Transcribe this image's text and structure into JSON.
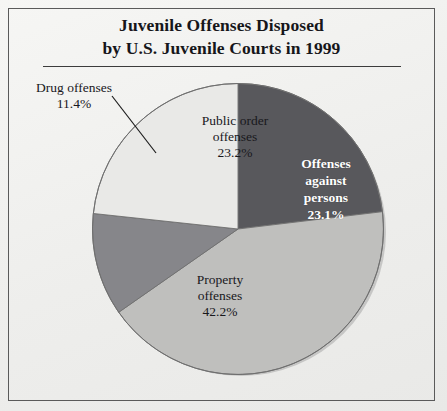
{
  "figure": {
    "title_line_1": "Juvenile Offenses Disposed",
    "title_line_2": "by U.S. Juvenile Courts in 1999"
  },
  "chart_data": {
    "type": "pie",
    "title": "Juvenile Offenses Disposed by U.S. Juvenile Courts in 1999",
    "xlabel": "",
    "ylabel": "",
    "legend_position": "none",
    "grid": false,
    "units": "percent",
    "categories": [
      "Offenses against persons",
      "Property offenses",
      "Drug offenses",
      "Public order offenses"
    ],
    "values": [
      23.1,
      42.2,
      11.4,
      23.2
    ],
    "slices": [
      {
        "label_line_1": "Offenses",
        "label_line_2": "against",
        "label_line_3": "persons",
        "name": "Offenses against persons",
        "value": 23.1,
        "value_label": "23.1%",
        "color": "#58585c",
        "label_color": "#ffffff",
        "start_angle_deg": 0,
        "end_angle_deg": 83.16,
        "leader_line": false
      },
      {
        "label_line_1": "Property",
        "label_line_2": "offenses",
        "name": "Property offenses",
        "value": 42.2,
        "value_label": "42.2%",
        "color": "#bfbfbd",
        "label_color": "#18181c",
        "start_angle_deg": 83.16,
        "end_angle_deg": 235.08,
        "leader_line": false
      },
      {
        "label_line_1": "Drug offenses",
        "name": "Drug offenses",
        "value": 11.4,
        "value_label": "11.4%",
        "color": "#86868a",
        "label_color": "#18181c",
        "start_angle_deg": 235.08,
        "end_angle_deg": 276.12,
        "leader_line": true
      },
      {
        "label_line_1": "Public order",
        "label_line_2": "offenses",
        "name": "Public order offenses",
        "value": 23.2,
        "value_label": "23.2%",
        "color": "#e9e9e7",
        "label_color": "#18181c",
        "start_angle_deg": 276.12,
        "end_angle_deg": 360,
        "leader_line": false
      }
    ],
    "total": 99.9
  }
}
